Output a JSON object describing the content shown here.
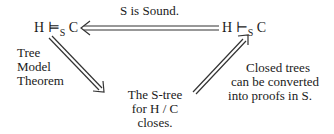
{
  "diagram": {
    "top_left_node": {
      "lhs": "H",
      "turnstile": "⊨",
      "subscript": "S",
      "rhs": "C"
    },
    "top_right_node": {
      "lhs": "H",
      "turnstile": "⊢",
      "subscript": "S",
      "rhs": "C"
    },
    "top_edge_label": "S is Sound.",
    "left_edge_label": [
      "Tree",
      "Model",
      "Theorem"
    ],
    "bottom_node": [
      "The S-tree",
      "for H / C",
      "closes."
    ],
    "right_edge_label": [
      "Closed trees",
      "can be converted",
      "into proofs in S."
    ]
  }
}
